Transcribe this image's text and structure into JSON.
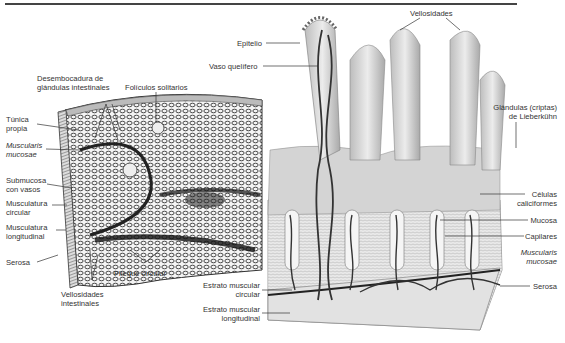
{
  "figure": {
    "left_panel": {
      "description": "Sección del intestino delgado con pliegue circular",
      "labels": {
        "desembocadura_1": "Desembocadura de",
        "desembocadura_2": "glándulas intestinales",
        "foliculos": "Folículos solitarios",
        "tunica_1": "Túnica",
        "tunica_2": "propia",
        "muscularis_1": "Muscularis",
        "muscularis_2": "mucosae",
        "submucosa_1": "Submucosa",
        "submucosa_2": "con vasos",
        "musc_circ_1": "Musculatura",
        "musc_circ_2": "circular",
        "musc_long_1": "Musculatura",
        "musc_long_2": "longitudinal",
        "serosa": "Serosa",
        "pliegue": "Pliegue circular",
        "vellosidades_1": "Vellosidades",
        "vellosidades_2": "intestinales"
      }
    },
    "right_panel": {
      "description": "Vellosidades y glándulas de la mucosa intestinal",
      "labels": {
        "vellosidades": "Vellosidades",
        "epitelio": "Epitelio",
        "vaso": "Vaso quelífero",
        "glandulas_1": "Glándulas (criptas)",
        "glandulas_2": "de Lieberkühn",
        "celulas_1": "Células",
        "celulas_2": "caliciformes",
        "mucosa": "Mucosa",
        "capilares": "Capilares",
        "muscularis_1": "Muscularis",
        "muscularis_2": "mucosae",
        "serosa": "Serosa",
        "estrato_circ_1": "Estrato muscular",
        "estrato_circ_2": "circular",
        "estrato_long_1": "Estrato muscular",
        "estrato_long_2": "longitudinal"
      }
    }
  }
}
